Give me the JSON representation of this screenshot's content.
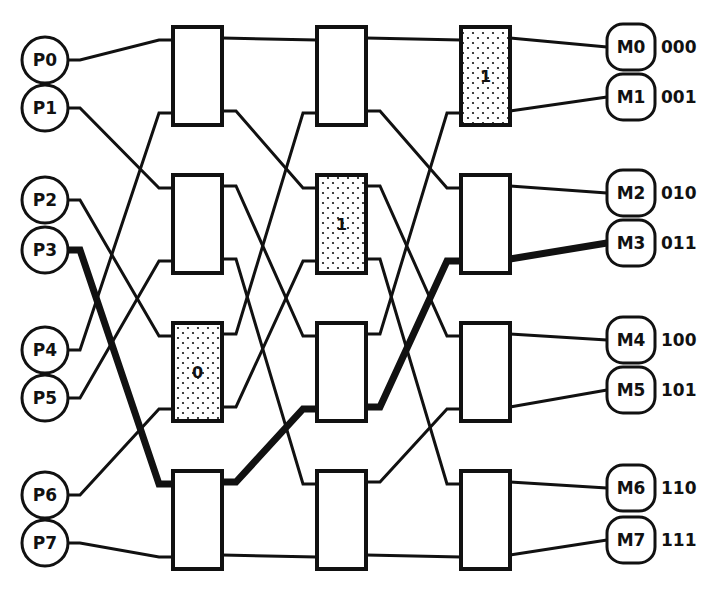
{
  "processors": [
    "P0",
    "P1",
    "P2",
    "P3",
    "P4",
    "P5",
    "P6",
    "P7"
  ],
  "memories": [
    {
      "label": "M0",
      "address": "000"
    },
    {
      "label": "M1",
      "address": "001"
    },
    {
      "label": "M2",
      "address": "010"
    },
    {
      "label": "M3",
      "address": "011"
    },
    {
      "label": "M4",
      "address": "100"
    },
    {
      "label": "M5",
      "address": "101"
    },
    {
      "label": "M6",
      "address": "110"
    },
    {
      "label": "M7",
      "address": "111"
    }
  ],
  "stages": 3,
  "switches_per_stage": 4,
  "interconnect": "perfect-shuffle",
  "highlighted_route": {
    "source": "P3",
    "destination": "M3",
    "destination_address": "011",
    "switches": [
      {
        "stage": 1,
        "switch": 3,
        "bit": "0"
      },
      {
        "stage": 2,
        "switch": 2,
        "bit": "1"
      },
      {
        "stage": 3,
        "switch": 1,
        "bit": "1"
      }
    ]
  },
  "colors": {
    "line": "#111111",
    "background": "#ffffff"
  }
}
